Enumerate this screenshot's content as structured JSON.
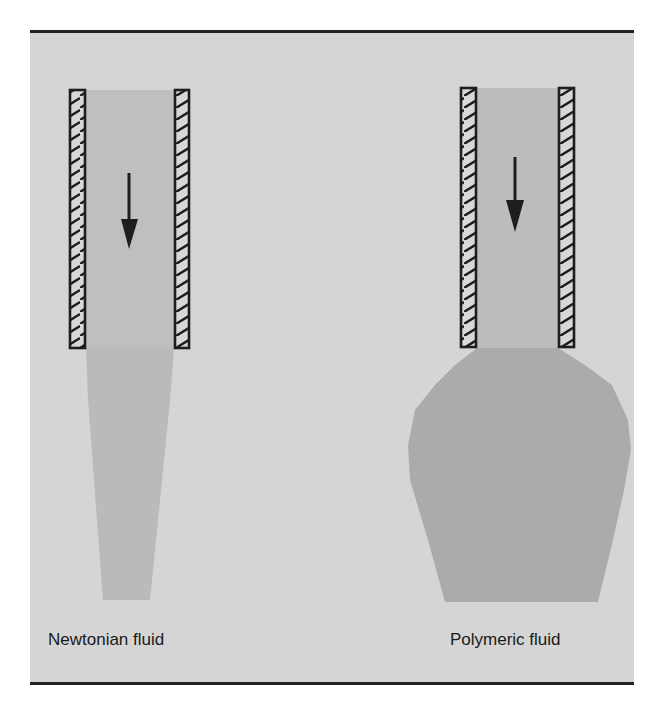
{
  "figure": {
    "colors": {
      "background": "#d5d5d5",
      "tube_fluid": "#bcbcbc",
      "newtonian_stream": "#b8b8b8",
      "polymeric_swell": "#aaaaaa",
      "wall_stroke": "#1e1e1e",
      "arrow": "#1e1e1e"
    },
    "panels": [
      {
        "id": "newtonian",
        "label": "Newtonian fluid",
        "arrow_direction": "down",
        "behavior": "stream contracts after exiting tube"
      },
      {
        "id": "polymeric",
        "label": "Polymeric fluid",
        "arrow_direction": "down",
        "behavior": "die swell - stream expands after exiting tube"
      }
    ]
  }
}
